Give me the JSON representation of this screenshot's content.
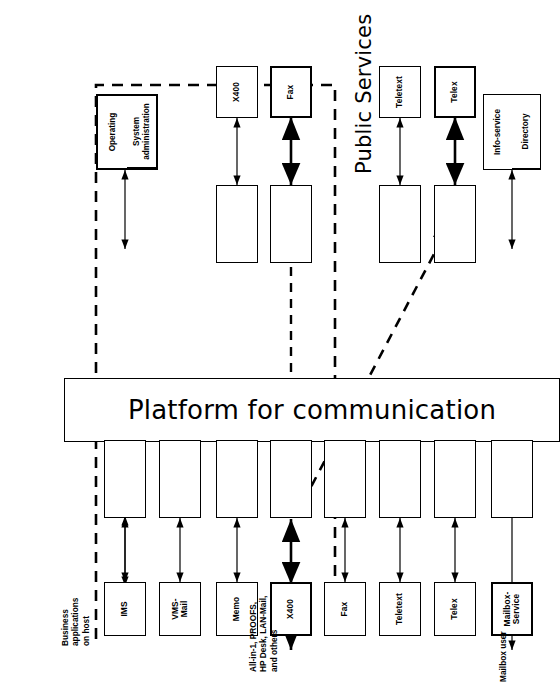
{
  "diagram": {
    "title": "Platform for communication",
    "public_services_label": "Public Services",
    "side_labels": {
      "business_apps": "Business\napplications\non host",
      "office_systems": "All-in-1, PROOFS,\nHP Desk, LAN-Mail,\nand others",
      "mailbox_user": "Mailbox user"
    },
    "left_boxes": [
      {
        "label": "IMS",
        "emphasis": "normal"
      },
      {
        "label": "VMS-\nMail",
        "emphasis": "normal"
      },
      {
        "label": "Memo",
        "emphasis": "normal"
      },
      {
        "label": "X400",
        "emphasis": "bold"
      },
      {
        "label": "Fax",
        "emphasis": "normal"
      },
      {
        "label": "Teletext",
        "emphasis": "normal"
      },
      {
        "label": "Telex",
        "emphasis": "normal"
      },
      {
        "label": "Mailbox-\nService",
        "emphasis": "bold"
      }
    ],
    "right_boxes": [
      {
        "label": "X400",
        "emphasis": "normal"
      },
      {
        "label": "Fax",
        "emphasis": "bold"
      },
      {
        "label": "Teletext",
        "emphasis": "normal"
      },
      {
        "label": "Telex",
        "emphasis": "bold"
      }
    ],
    "admin_box": {
      "cells": [
        "Operating",
        "System\nadministration"
      ]
    },
    "info_box": {
      "cells": [
        "Info-service",
        "Directory"
      ]
    },
    "interface_boxes_left": 8,
    "interface_boxes_right": 4,
    "colors": {
      "line": "#000000",
      "background": "#ffffff"
    }
  }
}
